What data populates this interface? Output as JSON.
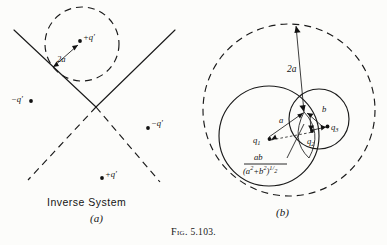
{
  "figure": {
    "caption_prefix": "Fig.",
    "caption_number": "5.103.",
    "background_color": "#fcfcfa",
    "ink_color": "#1a1a1a"
  },
  "panel_a": {
    "letter": "(a)",
    "title": "Inverse System",
    "radius_label": "2a",
    "charges": [
      {
        "id": "charge-top",
        "label": "+q′"
      },
      {
        "id": "charge-left",
        "label": "−q′"
      },
      {
        "id": "charge-right",
        "label": "−q′"
      },
      {
        "id": "charge-bottom",
        "label": "+q′"
      }
    ]
  },
  "panel_b": {
    "letter": "(b)",
    "diameter_label": "2a",
    "radius_a_label": "a",
    "radius_b_label": "b",
    "charges": [
      {
        "id": "charge-q1",
        "base": "q",
        "sub": "1"
      },
      {
        "id": "charge-q2",
        "base": "q",
        "sub": "2"
      },
      {
        "id": "charge-q3",
        "base": "q",
        "sub": "3"
      }
    ],
    "formula": {
      "numerator": "ab",
      "denominator_open": "(a",
      "denominator_exp1": "2",
      "denominator_plus": "+b",
      "denominator_exp2": "2",
      "denominator_close": ")",
      "denominator_power_num": "1",
      "denominator_power_den": "2"
    }
  }
}
